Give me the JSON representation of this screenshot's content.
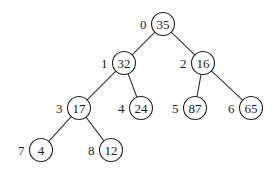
{
  "diagram": {
    "type": "binary-tree",
    "nodes": [
      {
        "index": "0",
        "value": "35",
        "x": 163,
        "y": 24
      },
      {
        "index": "1",
        "value": "32",
        "x": 124,
        "y": 63
      },
      {
        "index": "2",
        "value": "16",
        "x": 203,
        "y": 63
      },
      {
        "index": "3",
        "value": "17",
        "x": 79,
        "y": 108
      },
      {
        "index": "4",
        "value": "24",
        "x": 141,
        "y": 108
      },
      {
        "index": "5",
        "value": "87",
        "x": 195,
        "y": 108
      },
      {
        "index": "6",
        "value": "65",
        "x": 251,
        "y": 108
      },
      {
        "index": "7",
        "value": "4",
        "x": 41,
        "y": 150
      },
      {
        "index": "8",
        "value": "12",
        "x": 111,
        "y": 150
      }
    ],
    "edges": [
      {
        "from": 0,
        "to": 1
      },
      {
        "from": 0,
        "to": 2
      },
      {
        "from": 1,
        "to": 3
      },
      {
        "from": 1,
        "to": 4
      },
      {
        "from": 2,
        "to": 5
      },
      {
        "from": 2,
        "to": 6
      },
      {
        "from": 3,
        "to": 7
      },
      {
        "from": 3,
        "to": 8
      }
    ],
    "node_radius": 11.5,
    "colors": {
      "stroke": "#222222",
      "fill": "#ffffff",
      "text": "#222222"
    }
  }
}
